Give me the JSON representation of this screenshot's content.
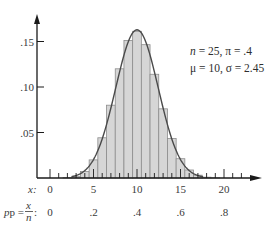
{
  "chart_data": {
    "type": "bar",
    "subtype": "histogram-with-normal-curve",
    "title": "",
    "xlabel": "x",
    "secondary_xlabel": "p = x/n",
    "ylabel": "",
    "note": "Bar heights are binomial PMF values computed from the stated parameters (n = 25, π = .4), not measured from the image. The overlaid curve is the normal density with μ = 10, σ = 2.45.",
    "x": [
      0,
      1,
      2,
      3,
      4,
      5,
      6,
      7,
      8,
      9,
      10,
      11,
      12,
      13,
      14,
      15,
      16,
      17,
      18,
      19,
      20,
      21,
      22,
      23,
      24,
      25
    ],
    "values": [
      0.0,
      0.0,
      0.0004,
      0.0019,
      0.0071,
      0.0199,
      0.0442,
      0.08,
      0.12,
      0.1511,
      0.1612,
      0.1465,
      0.114,
      0.076,
      0.0434,
      0.0212,
      0.0088,
      0.0031,
      0.0009,
      0.0002,
      0.0,
      0.0,
      0.0,
      0.0,
      0.0,
      0.0
    ],
    "curve": {
      "type": "normal",
      "mu": 10,
      "sigma": 2.45
    },
    "ylim": [
      0,
      0.17
    ],
    "xlim": [
      0,
      24
    ],
    "y_ticks": [
      0.05,
      0.1,
      0.15
    ],
    "y_tick_labels": [
      ".05",
      ".10",
      ".15"
    ],
    "x_ticks": [
      0,
      5,
      10,
      15,
      20
    ],
    "x_tick_labels": [
      "0",
      "5",
      "10",
      "15",
      "20"
    ],
    "p_tick_labels": [
      "0",
      ".2",
      ".4",
      ".6",
      ".8"
    ],
    "grid": false,
    "legend": null
  },
  "annotations": {
    "line1": {
      "n_sym": "n",
      "n_val": " = 25,  ",
      "pi_sym": "π",
      "pi_val": " = .4"
    },
    "line2": {
      "mu_sym": "μ",
      "mu_val": " = 10,  ",
      "sigma_sym": "σ",
      "sigma_val": " = 2.45"
    }
  },
  "axis_labels": {
    "x_row": "x:",
    "p_row_prefix": "p = ",
    "p_row_num": "x",
    "p_row_den": "n",
    "p_row_suffix": ":"
  },
  "colors": {
    "bar_fill": "#d6d6d6",
    "bar_stroke": "#8c8c8c",
    "curve": "#4a4a4a",
    "axis": "#1a1a1a",
    "text": "#3a3a3a"
  }
}
